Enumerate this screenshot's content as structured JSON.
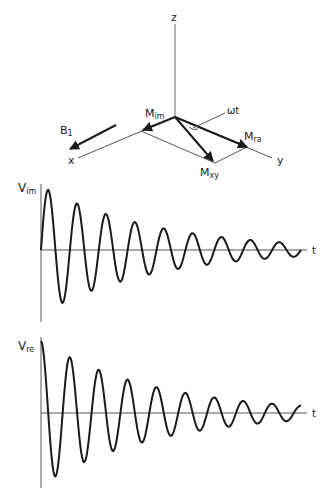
{
  "figure": {
    "vector_diagram": {
      "axes": {
        "z": "z",
        "x": "x",
        "y": "y"
      },
      "vectors": [
        {
          "name": "M",
          "sub": "im"
        },
        {
          "name": "M",
          "sub": "ra"
        },
        {
          "name": "M",
          "sub": "xy"
        },
        {
          "name": "B",
          "sub": "1"
        }
      ],
      "angle_label": "ωt"
    },
    "signals": [
      {
        "name": "V",
        "sub": "im",
        "time_label": "t",
        "phase": "sine",
        "cycles": 9,
        "decay": "exponential"
      },
      {
        "name": "V",
        "sub": "re",
        "time_label": "t",
        "phase": "cosine",
        "cycles": 9,
        "decay": "exponential"
      }
    ]
  },
  "colors": {
    "line": "#1a1a1a",
    "axis": "#555555",
    "background": "#ffffff"
  }
}
